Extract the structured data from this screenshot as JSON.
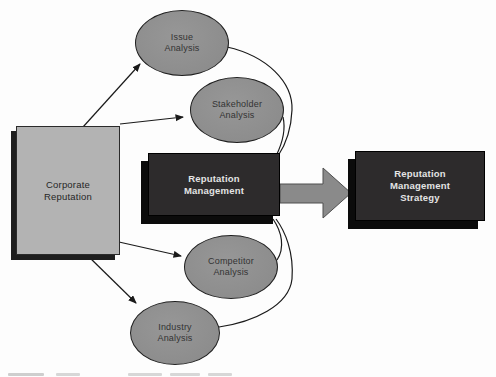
{
  "diagram": {
    "title_context": "Reputation management process diagram",
    "source_node": {
      "label": "Corporate\nReputation"
    },
    "analysis_nodes": [
      {
        "id": "issue",
        "label": "Issue\nAnalysis"
      },
      {
        "id": "stakeholder",
        "label": "Stakeholder\nAnalysis"
      },
      {
        "id": "competitor",
        "label": "Competitor\nAnalysis"
      },
      {
        "id": "industry",
        "label": "Industry\nAnalysis"
      }
    ],
    "process_node": {
      "label": "Reputation\nManagement"
    },
    "output_node": {
      "label": "Reputation\nManagement\nStrategy"
    },
    "connectors": {
      "straight_arrows": [
        "corporate-to-issue",
        "corporate-to-stakeholder",
        "corporate-to-competitor",
        "corporate-to-industry"
      ],
      "feedback_curves": [
        "issue-to-management",
        "stakeholder-to-management",
        "competitor-to-management",
        "industry-to-management"
      ],
      "big_arrow": "management-to-strategy"
    },
    "colors": {
      "background": "#fdfdfd",
      "oval_fill": "#8f8f8f",
      "oval_border": "#1f1f1f",
      "light_box_fill": "#b3b3b3",
      "dark_box_fill": "#2d2b2c",
      "dark_box_text": "#e4e4e4",
      "shadow": "#0b0b0b",
      "line": "#1a1a1a",
      "big_arrow_fill": "#8a8a8a"
    }
  }
}
